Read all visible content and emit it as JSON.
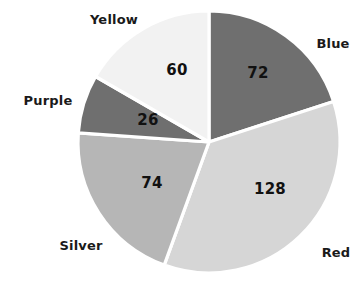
{
  "chart_data": {
    "type": "pie",
    "title": "",
    "subtitle": "",
    "xlabel": "",
    "ylabel": "",
    "legend_position": "outside-labels",
    "grid": false,
    "total": 360,
    "start_angle_deg": 0,
    "direction": "clockwise",
    "categories": [
      "Blue",
      "Red",
      "Silver",
      "Purple",
      "Yellow"
    ],
    "values": [
      72,
      128,
      74,
      26,
      60
    ],
    "slices": [
      {
        "label": "Blue",
        "value": 72,
        "value_text": "72",
        "color": "#6f6f6f",
        "start_deg": 0,
        "end_deg": 72,
        "label_x": 333,
        "label_y": 43,
        "value_x": 258,
        "value_y": 73
      },
      {
        "label": "Red",
        "value": 128,
        "value_text": "128",
        "color": "#d6d6d6",
        "start_deg": 72,
        "end_deg": 200,
        "label_x": 336,
        "label_y": 252,
        "value_x": 270,
        "value_y": 189
      },
      {
        "label": "Silver",
        "value": 74,
        "value_text": "74",
        "color": "#b6b6b6",
        "start_deg": 200,
        "end_deg": 274,
        "label_x": 81,
        "label_y": 245,
        "value_x": 152,
        "value_y": 183
      },
      {
        "label": "Purple",
        "value": 26,
        "value_text": "26",
        "color": "#6f6f6f",
        "start_deg": 274,
        "end_deg": 300,
        "label_x": 48,
        "label_y": 100,
        "value_x": 148,
        "value_y": 120
      },
      {
        "label": "Yellow",
        "value": 60,
        "value_text": "60",
        "color": "#f2f2f2",
        "start_deg": 300,
        "end_deg": 360,
        "label_x": 114,
        "label_y": 19,
        "value_x": 177,
        "value_y": 70
      }
    ],
    "geometry": {
      "center_x": 209,
      "center_y": 142,
      "radius": 131
    },
    "colors": {
      "background": "#ffffff",
      "separator": "#ffffff",
      "text": "#1a1a1a"
    }
  }
}
